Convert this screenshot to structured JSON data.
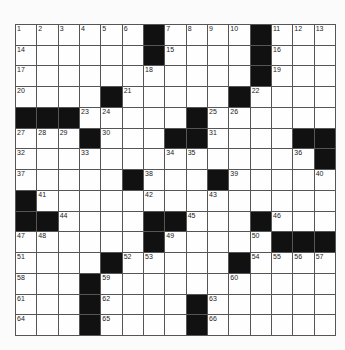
{
  "puzzle": {
    "size": [
      15,
      15
    ],
    "grid": [
      [
        "1",
        "2",
        "3",
        "4",
        "5",
        "6",
        "#",
        "7",
        "8",
        "9",
        "10",
        "#",
        "11",
        "12",
        "13"
      ],
      [
        "14",
        "",
        "",
        "",
        "",
        "",
        "#",
        "15",
        "",
        "",
        "",
        "#",
        "16",
        "",
        ""
      ],
      [
        "17",
        "",
        "",
        "",
        "",
        "",
        "18",
        "",
        "",
        "",
        "",
        "#",
        "19",
        "",
        ""
      ],
      [
        "20",
        "",
        "",
        "",
        "#",
        "21",
        "",
        "",
        "",
        "",
        "#",
        "22",
        "",
        "",
        ""
      ],
      [
        "#",
        "#",
        "#",
        "23",
        "24",
        "",
        "",
        "",
        "#",
        "25",
        "26",
        "",
        "",
        "",
        ""
      ],
      [
        "27",
        "28",
        "29",
        "#",
        "30",
        "",
        "",
        "#",
        "#",
        "31",
        "",
        "",
        "",
        "#",
        "#"
      ],
      [
        "32",
        "",
        "",
        "33",
        "",
        "",
        "",
        "34",
        "35",
        "",
        "",
        "",
        "",
        "36",
        "#"
      ],
      [
        "37",
        "",
        "",
        "",
        "",
        "#",
        "38",
        "",
        "",
        "#",
        "39",
        "",
        "",
        "",
        "40"
      ],
      [
        "#",
        "41",
        "",
        "",
        "",
        "",
        "42",
        "",
        "",
        "43",
        "",
        "",
        "",
        "",
        ""
      ],
      [
        "#",
        "#",
        "44",
        "",
        "",
        "",
        "#",
        "#",
        "45",
        "",
        "",
        "#",
        "46",
        "",
        ""
      ],
      [
        "47",
        "48",
        "",
        "",
        "",
        "",
        "#",
        "49",
        "",
        "",
        "",
        "50",
        "#",
        "#",
        "#"
      ],
      [
        "51",
        "",
        "",
        "",
        "#",
        "52",
        "53",
        "",
        "",
        "",
        "#",
        "54",
        "55",
        "56",
        "57"
      ],
      [
        "58",
        "",
        "",
        "#",
        "59",
        "",
        "",
        "",
        "",
        "",
        "60",
        "",
        "",
        "",
        ""
      ],
      [
        "61",
        "",
        "",
        "#",
        "62",
        "",
        "",
        "",
        "#",
        "63",
        "",
        "",
        "",
        "",
        ""
      ],
      [
        "64",
        "",
        "",
        "#",
        "65",
        "",
        "",
        "",
        "#",
        "66",
        "",
        "",
        "",
        "",
        ""
      ]
    ],
    "colors": {
      "block": "#111111",
      "cell": "#fefefe",
      "line": "#555555"
    }
  }
}
